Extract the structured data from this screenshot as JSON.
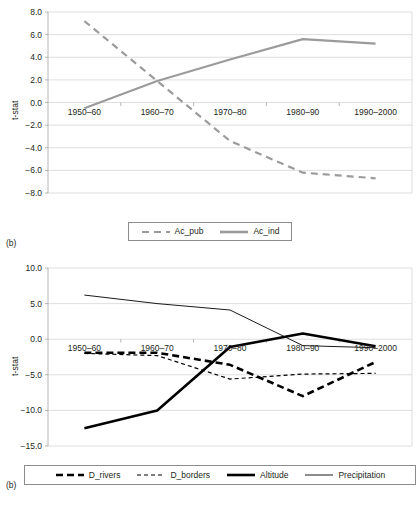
{
  "figure": {
    "background": "#ffffff",
    "text_color": "#231f20"
  },
  "panels": [
    {
      "tag": "(b)",
      "ylabel": "t-stat",
      "legend_position": "bottom-center"
    },
    {
      "tag": "(b)",
      "ylabel": "t-stat",
      "legend_position": "bottom-center"
    }
  ],
  "chart_data": [
    {
      "type": "line",
      "title": "",
      "panel_tag": "(b)",
      "xlabel": "",
      "ylabel": "t-stat",
      "categories": [
        "1950–60",
        "1960–70",
        "1970–80",
        "1980–90",
        "1990–2000"
      ],
      "ylim": [
        -8.0,
        8.0
      ],
      "yticks": [
        8.0,
        6.0,
        4.0,
        2.0,
        0.0,
        -2.0,
        -4.0,
        -6.0,
        -8.0
      ],
      "ytick_labels": [
        "8.0",
        "6.0",
        "4.0",
        "2.0",
        "0.0",
        "−2.0",
        "−4.0",
        "−6.0",
        "−8.0"
      ],
      "grid": true,
      "legend_position": "bottom",
      "series": [
        {
          "name": "Ac_pub",
          "values": [
            7.2,
            1.9,
            -3.4,
            -6.2,
            -6.7
          ],
          "style": "dashed",
          "color": "#9b9b9b",
          "width": 2.2
        },
        {
          "name": "Ac_ind",
          "values": [
            -0.5,
            1.9,
            3.8,
            5.6,
            5.2
          ],
          "style": "solid",
          "color": "#9b9b9b",
          "width": 2.2
        }
      ]
    },
    {
      "type": "line",
      "title": "",
      "panel_tag": "(b)",
      "xlabel": "",
      "ylabel": "t-stat",
      "categories": [
        "1950–60",
        "1960–70",
        "1970–80",
        "1980–90",
        "1990–2000"
      ],
      "ylim": [
        -15.0,
        10.0
      ],
      "yticks": [
        10.0,
        5.0,
        0.0,
        -5.0,
        -10.0,
        -15.0
      ],
      "ytick_labels": [
        "10.0",
        "5.0",
        "0.0",
        "−5.0",
        "−10.0",
        "−15.0"
      ],
      "grid": true,
      "legend_position": "bottom",
      "series": [
        {
          "name": "D_rivers",
          "values": [
            -1.9,
            -1.9,
            -3.6,
            -8.0,
            -3.2
          ],
          "style": "heavy-dashed",
          "color": "#000000",
          "width": 2.6
        },
        {
          "name": "D_borders",
          "values": [
            -2.0,
            -2.3,
            -5.6,
            -4.9,
            -4.8
          ],
          "style": "fine-dashed",
          "color": "#000000",
          "width": 1.2
        },
        {
          "name": "Altitude",
          "values": [
            -12.5,
            -10.0,
            -1.1,
            0.8,
            -1.0
          ],
          "style": "solid",
          "color": "#000000",
          "width": 2.6
        },
        {
          "name": "Precipitation",
          "values": [
            6.2,
            5.0,
            4.1,
            -0.9,
            -1.2
          ],
          "style": "thin-solid",
          "color": "#000000",
          "width": 0.9
        }
      ]
    }
  ],
  "legends": [
    {
      "items": [
        {
          "label": "Ac_pub",
          "style": "dashed",
          "color": "#9b9b9b"
        },
        {
          "label": "Ac_ind",
          "style": "solid",
          "color": "#9b9b9b"
        }
      ]
    },
    {
      "items": [
        {
          "label": "D_rivers",
          "style": "heavy-dashed",
          "color": "#000000"
        },
        {
          "label": "D_borders",
          "style": "fine-dashed",
          "color": "#000000"
        },
        {
          "label": "Altitude",
          "style": "solid",
          "color": "#000000"
        },
        {
          "label": "Precipitation",
          "style": "thin-solid",
          "color": "#000000"
        }
      ]
    }
  ]
}
